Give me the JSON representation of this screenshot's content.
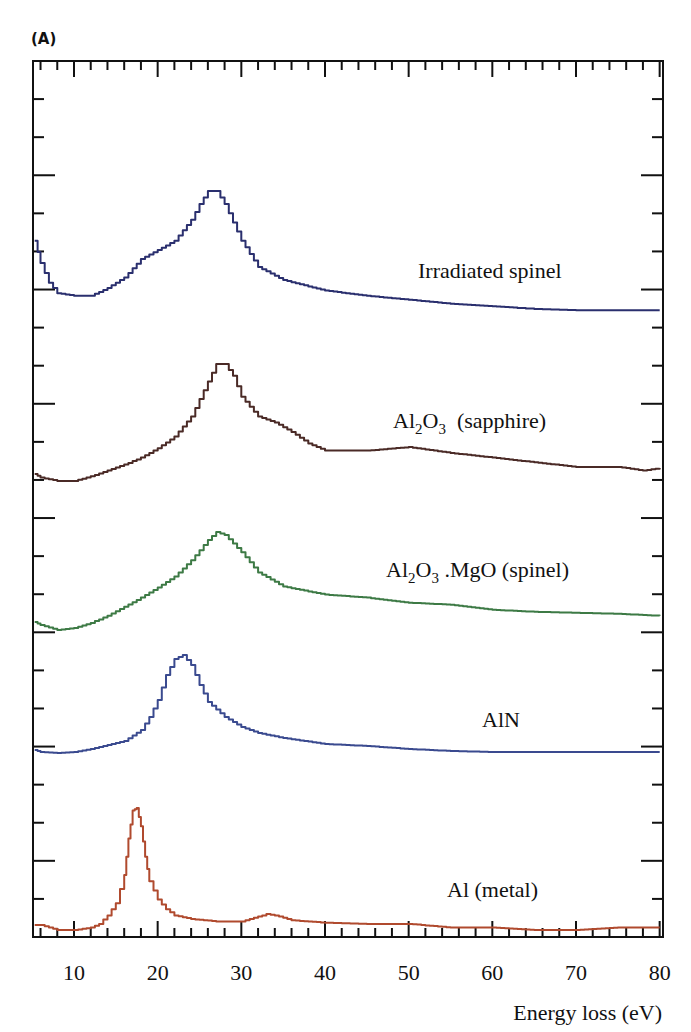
{
  "figure": {
    "panel_label": "(A)",
    "x_axis_title": "Energy loss (eV)",
    "x_tick_labels": [
      "10",
      "20",
      "30",
      "40",
      "50",
      "60",
      "70",
      "80"
    ]
  },
  "labels": {
    "irradiated_spinel": "Irradiated spinel",
    "sapphire_pre": "Al",
    "sapphire_sub1": "2",
    "sapphire_mid": "O",
    "sapphire_sub2": "3",
    "sapphire_post": "  (sapphire)",
    "spinel_pre": "Al",
    "spinel_sub1": "2",
    "spinel_mid": "O",
    "spinel_sub2": "3",
    "spinel_post": " .MgO (spinel)",
    "aln": "AlN",
    "al_metal": "Al (metal)"
  },
  "colors": {
    "irradiated_spinel": "#2a2f6e",
    "sapphire": "#4a2a26",
    "spinel": "#3d7a45",
    "aln": "#3a4a8f",
    "al_metal": "#b04a2e",
    "axis": "#111111"
  },
  "chart_data": {
    "type": "line",
    "title": "(A)",
    "xlabel": "Energy loss (eV)",
    "ylabel": "",
    "xlim": [
      5.1,
      80.4
    ],
    "x_ticks": [
      10,
      20,
      30,
      40,
      50,
      60,
      70,
      80
    ],
    "y_ticks_labeled": false,
    "grid": false,
    "legend": "inline labels next to each curve",
    "note": "Stacked (vertically offset) EELS spectra; y values are relative intensity in arbitrary units (0 = curve baseline, 1 = curve peak).",
    "series": [
      {
        "name": "Irradiated spinel",
        "x": [
          5.3,
          6,
          7,
          8,
          10,
          12,
          14,
          16,
          18,
          20,
          22,
          24,
          25,
          26,
          27,
          28,
          30,
          32,
          35,
          40,
          45,
          50,
          55,
          60,
          65,
          70,
          75,
          80
        ],
        "y": [
          0.62,
          0.45,
          0.3,
          0.22,
          0.2,
          0.2,
          0.26,
          0.34,
          0.48,
          0.55,
          0.62,
          0.78,
          0.9,
          1.0,
          1.0,
          0.9,
          0.62,
          0.42,
          0.32,
          0.24,
          0.2,
          0.17,
          0.14,
          0.12,
          0.1,
          0.09,
          0.09,
          0.09
        ]
      },
      {
        "name": "Al2O3 (sapphire)",
        "x": [
          5.3,
          6,
          8,
          10,
          12,
          14,
          16,
          18,
          20,
          22,
          24,
          26,
          27,
          28,
          29,
          30,
          32,
          34,
          36,
          38,
          40,
          45,
          50,
          55,
          60,
          65,
          70,
          75,
          78,
          80
        ],
        "y": [
          0.06,
          0.03,
          0.0,
          0.0,
          0.04,
          0.09,
          0.14,
          0.2,
          0.28,
          0.38,
          0.55,
          0.85,
          1.0,
          1.0,
          0.9,
          0.72,
          0.55,
          0.5,
          0.42,
          0.32,
          0.26,
          0.26,
          0.29,
          0.24,
          0.2,
          0.16,
          0.12,
          0.12,
          0.09,
          0.11
        ]
      },
      {
        "name": "Al2O3.MgO (spinel)",
        "x": [
          5.3,
          6,
          8,
          10,
          12,
          14,
          16,
          18,
          20,
          22,
          24,
          26,
          27,
          28,
          30,
          32,
          35,
          40,
          45,
          50,
          55,
          60,
          65,
          70,
          75,
          80
        ],
        "y": [
          0.11,
          0.08,
          0.03,
          0.05,
          0.1,
          0.17,
          0.26,
          0.35,
          0.45,
          0.56,
          0.72,
          0.92,
          1.0,
          0.97,
          0.8,
          0.6,
          0.46,
          0.38,
          0.35,
          0.3,
          0.28,
          0.23,
          0.21,
          0.2,
          0.19,
          0.17
        ]
      },
      {
        "name": "AlN",
        "x": [
          5.3,
          6,
          8,
          10,
          12,
          14,
          16,
          18,
          19,
          20,
          21,
          22,
          23,
          24,
          25,
          26,
          28,
          30,
          32,
          35,
          40,
          45,
          50,
          55,
          60,
          65,
          70,
          75,
          80
        ],
        "y": [
          0.05,
          0.03,
          0.02,
          0.03,
          0.06,
          0.1,
          0.14,
          0.25,
          0.38,
          0.55,
          0.8,
          0.96,
          1.0,
          0.9,
          0.7,
          0.53,
          0.38,
          0.28,
          0.22,
          0.17,
          0.11,
          0.09,
          0.06,
          0.04,
          0.03,
          0.03,
          0.03,
          0.03,
          0.03
        ]
      },
      {
        "name": "Al (metal)",
        "x": [
          5.3,
          6,
          8,
          10,
          12,
          13,
          14,
          15,
          16,
          16.5,
          17,
          17.5,
          18,
          18.5,
          19,
          20,
          21,
          22,
          24,
          27,
          30,
          32,
          33,
          34,
          35,
          36,
          38,
          40,
          45,
          50,
          55,
          60,
          65,
          70,
          75,
          80
        ],
        "y": [
          0.04,
          0.04,
          0.0,
          0.0,
          0.02,
          0.05,
          0.12,
          0.22,
          0.45,
          0.75,
          0.98,
          1.0,
          0.85,
          0.6,
          0.4,
          0.25,
          0.17,
          0.12,
          0.09,
          0.07,
          0.07,
          0.11,
          0.13,
          0.12,
          0.1,
          0.08,
          0.07,
          0.06,
          0.05,
          0.05,
          0.02,
          0.02,
          0.0,
          0.0,
          0.02,
          0.02
        ]
      }
    ]
  }
}
